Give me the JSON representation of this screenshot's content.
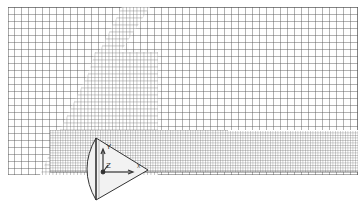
{
  "diagram": {
    "title": "",
    "type": "mesh",
    "colors": {
      "background": "#ffffff",
      "grid_line": "#555555",
      "grid_line_fine": "#6a6a6a",
      "cone_fill": "#f2f2f2",
      "cone_stroke": "#333333",
      "axis": "#333333"
    },
    "mesh": {
      "coarse_region": {
        "x": 8,
        "y": 7,
        "width": 350,
        "height": 168,
        "cell": 7
      },
      "refined_regions": [
        {
          "name": "diagonal-band",
          "points": "125,7 150,7 110,70 75,175 50,175"
        },
        {
          "name": "upper-block",
          "points": "95,50 158,50 158,175 70,175"
        },
        {
          "name": "wake-block",
          "points": "50,130 358,130 358,172 50,172"
        }
      ]
    },
    "cone": {
      "base_top": [
        96,
        138
      ],
      "base_bottom": [
        96,
        200
      ],
      "tip": [
        148,
        170
      ],
      "base_bulge_x": 82
    },
    "axes_triad": {
      "origin": [
        103,
        172
      ],
      "labels": {
        "y": "Y",
        "z": "Z",
        "x": "X"
      }
    }
  }
}
